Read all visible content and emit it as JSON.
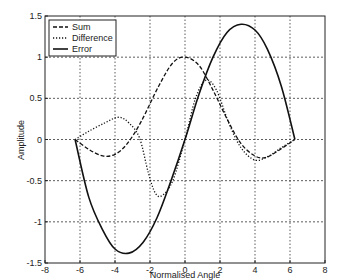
{
  "chart_data": {
    "type": "line",
    "title": "",
    "xlabel": "Normalised Angle",
    "ylabel": "Amplitude",
    "xlim": [
      -8,
      8
    ],
    "ylim": [
      -1.5,
      1.5
    ],
    "xticks": [
      -8,
      -6,
      -4,
      -2,
      0,
      2,
      4,
      6,
      8
    ],
    "yticks": [
      -1.5,
      -1,
      -0.5,
      0,
      0.5,
      1,
      1.5
    ],
    "xtick_labels": [
      "-8",
      "-6",
      "-4",
      "-2",
      "0",
      "2",
      "4",
      "6",
      "8"
    ],
    "ytick_labels": [
      "-1.5",
      "-1",
      "-0.5",
      "0",
      "0.5",
      "1",
      "1.5"
    ],
    "grid": true,
    "legend_position": "upper left",
    "series": [
      {
        "name": "Sum",
        "style": "dashed",
        "x": [
          -6.28,
          -5.5,
          -4.7,
          -4.0,
          -3.3,
          -2.5,
          -1.5,
          -0.7,
          0,
          0.8,
          1.6,
          2.4,
          3.2,
          4.0,
          4.6,
          5.3,
          6.28
        ],
        "y": [
          0,
          -0.12,
          -0.2,
          -0.18,
          -0.05,
          0.22,
          0.65,
          0.93,
          1.0,
          0.9,
          0.6,
          0.25,
          -0.05,
          -0.2,
          -0.22,
          -0.14,
          0
        ]
      },
      {
        "name": "Difference",
        "style": "dotted",
        "x": [
          -6.28,
          -5.5,
          -4.6,
          -3.8,
          -3.2,
          -2.6,
          -2.1,
          -1.7,
          -1.3,
          -0.7,
          0,
          0.6,
          1.2,
          1.8,
          2.5,
          3.2,
          4.0,
          4.8,
          5.5,
          6.28
        ],
        "y": [
          0,
          0.1,
          0.2,
          0.27,
          0.2,
          0.02,
          -0.4,
          -0.65,
          -0.68,
          -0.5,
          0.0,
          0.5,
          0.72,
          0.6,
          0.2,
          -0.1,
          -0.25,
          -0.2,
          -0.1,
          0
        ]
      },
      {
        "name": "Error",
        "style": "solid",
        "x": [
          -6.28,
          -5.5,
          -4.7,
          -4.0,
          -3.2,
          -2.4,
          -1.6,
          -0.8,
          0,
          0.8,
          1.6,
          2.4,
          3.2,
          4.0,
          4.7,
          5.5,
          6.28
        ],
        "y": [
          0,
          -0.7,
          -1.1,
          -1.33,
          -1.38,
          -1.25,
          -0.95,
          -0.5,
          0,
          0.55,
          1.0,
          1.3,
          1.4,
          1.33,
          1.1,
          0.65,
          0
        ]
      }
    ]
  }
}
